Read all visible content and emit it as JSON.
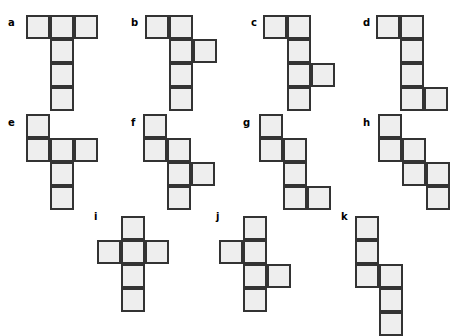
{
  "figure": {
    "title": "",
    "cell_size_px": 24,
    "cell_fill_color": "#eeeeee",
    "cell_border_color": "#333333",
    "background_color": "#ffffff",
    "label_color": "#000000"
  },
  "shapes": [
    {
      "label": "a",
      "label_x": 8,
      "label_y": 18,
      "origin_x": 26,
      "origin_y": 15,
      "cell_count": 6,
      "cells": [
        [
          0,
          0
        ],
        [
          0,
          1
        ],
        [
          0,
          2
        ],
        [
          1,
          1
        ],
        [
          2,
          1
        ],
        [
          3,
          1
        ]
      ]
    },
    {
      "label": "b",
      "label_x": 131,
      "label_y": 18,
      "origin_x": 145,
      "origin_y": 15,
      "cell_count": 6,
      "cells": [
        [
          0,
          0
        ],
        [
          0,
          1
        ],
        [
          1,
          1
        ],
        [
          1,
          2
        ],
        [
          2,
          1
        ],
        [
          3,
          1
        ]
      ]
    },
    {
      "label": "c",
      "label_x": 251,
      "label_y": 18,
      "origin_x": 263,
      "origin_y": 15,
      "cell_count": 6,
      "cells": [
        [
          0,
          0
        ],
        [
          0,
          1
        ],
        [
          1,
          1
        ],
        [
          2,
          1
        ],
        [
          2,
          2
        ],
        [
          3,
          1
        ]
      ]
    },
    {
      "label": "d",
      "label_x": 363,
      "label_y": 18,
      "origin_x": 376,
      "origin_y": 15,
      "cell_count": 6,
      "cells": [
        [
          0,
          0
        ],
        [
          0,
          1
        ],
        [
          1,
          1
        ],
        [
          2,
          1
        ],
        [
          3,
          1
        ],
        [
          3,
          2
        ]
      ]
    },
    {
      "label": "e",
      "label_x": 8,
      "label_y": 118,
      "origin_x": 26,
      "origin_y": 114,
      "cell_count": 6,
      "cells": [
        [
          0,
          0
        ],
        [
          1,
          0
        ],
        [
          1,
          1
        ],
        [
          1,
          2
        ],
        [
          2,
          1
        ],
        [
          3,
          1
        ]
      ]
    },
    {
      "label": "f",
      "label_x": 131,
      "label_y": 118,
      "origin_x": 143,
      "origin_y": 114,
      "cell_count": 6,
      "cells": [
        [
          0,
          0
        ],
        [
          1,
          0
        ],
        [
          1,
          1
        ],
        [
          2,
          1
        ],
        [
          2,
          2
        ],
        [
          3,
          1
        ]
      ]
    },
    {
      "label": "g",
      "label_x": 243,
      "label_y": 118,
      "origin_x": 259,
      "origin_y": 114,
      "cell_count": 6,
      "cells": [
        [
          0,
          0
        ],
        [
          1,
          0
        ],
        [
          1,
          1
        ],
        [
          2,
          1
        ],
        [
          3,
          1
        ],
        [
          3,
          2
        ]
      ]
    },
    {
      "label": "h",
      "label_x": 363,
      "label_y": 118,
      "origin_x": 378,
      "origin_y": 114,
      "cell_count": 6,
      "cells": [
        [
          0,
          0
        ],
        [
          1,
          0
        ],
        [
          1,
          1
        ],
        [
          2,
          1
        ],
        [
          2,
          2
        ],
        [
          3,
          2
        ]
      ]
    },
    {
      "label": "i",
      "label_x": 94,
      "label_y": 212,
      "origin_x": 97,
      "origin_y": 216,
      "cell_count": 6,
      "cells": [
        [
          0,
          1
        ],
        [
          1,
          0
        ],
        [
          1,
          1
        ],
        [
          1,
          2
        ],
        [
          2,
          1
        ],
        [
          3,
          1
        ]
      ]
    },
    {
      "label": "j",
      "label_x": 216,
      "label_y": 212,
      "origin_x": 219,
      "origin_y": 216,
      "cell_count": 6,
      "cells": [
        [
          0,
          1
        ],
        [
          1,
          0
        ],
        [
          1,
          1
        ],
        [
          2,
          1
        ],
        [
          2,
          2
        ],
        [
          3,
          1
        ]
      ]
    },
    {
      "label": "k",
      "label_x": 341,
      "label_y": 212,
      "origin_x": 355,
      "origin_y": 216,
      "cell_count": 6,
      "cells": [
        [
          0,
          0
        ],
        [
          1,
          0
        ],
        [
          2,
          0
        ],
        [
          2,
          1
        ],
        [
          3,
          1
        ],
        [
          4,
          1
        ]
      ]
    }
  ]
}
